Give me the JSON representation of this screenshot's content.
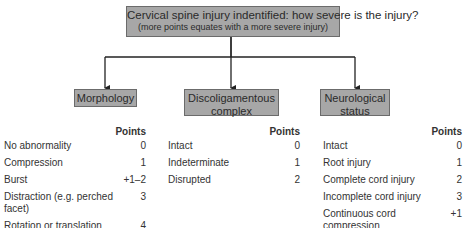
{
  "title": {
    "line1": "Cervical spine injury indentified: how severe is the injury?",
    "line2": "(more points equates with a more severe injury)"
  },
  "categories": {
    "morphology": {
      "label": "Morphology",
      "points_header": "Points",
      "rows": [
        {
          "label": "No abnormality",
          "points": "0"
        },
        {
          "label": "Compression",
          "points": "1"
        },
        {
          "label": "Burst",
          "points": "+1–2"
        },
        {
          "label": "Distraction (e.g. perched facet)",
          "points": "3"
        },
        {
          "label": "Rotation or translation\n(e.g. facet dislocation)",
          "points": "4"
        }
      ]
    },
    "discoligamentous": {
      "label": "Discoligamentous complex",
      "points_header": "Points",
      "rows": [
        {
          "label": "Intact",
          "points": "0"
        },
        {
          "label": "Indeterminate",
          "points": "1"
        },
        {
          "label": "Disrupted",
          "points": "2"
        }
      ]
    },
    "neurological": {
      "label": "Neurological status",
      "points_header": "Points",
      "rows": [
        {
          "label": "Intact",
          "points": "0"
        },
        {
          "label": "Root injury",
          "points": "1"
        },
        {
          "label": "Complete cord injury",
          "points": "2"
        },
        {
          "label": "Incomplete cord injury",
          "points": "3"
        },
        {
          "label": "Continuous cord compression\nin the setting of neuro. deficit",
          "points": "+1"
        }
      ]
    }
  },
  "colors": {
    "box_fill": "#a7a7a7",
    "box_border": "#6b6b6b",
    "arrow": "#222222"
  }
}
